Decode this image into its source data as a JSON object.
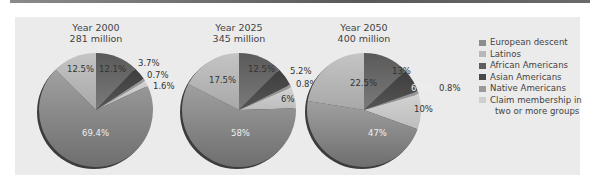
{
  "chart_data": [
    {
      "type": "pie",
      "title": "Year 2000",
      "subtitle": "281 million",
      "categories": [
        "European descent",
        "Latinos",
        "African Americans",
        "Asian Americans",
        "Native Americans",
        "Claim membership in two or more groups"
      ],
      "values": [
        69.4,
        12.5,
        12.1,
        3.7,
        0.7,
        1.6
      ],
      "labels": [
        "69.4%",
        "12.5%",
        "12.1%",
        "3.7%",
        "0.7%",
        "1.6%"
      ]
    },
    {
      "type": "pie",
      "title": "Year 2025",
      "subtitle": "345 million",
      "categories": [
        "European descent",
        "Latinos",
        "African Americans",
        "Asian Americans",
        "Native Americans",
        "Claim membership in two or more groups"
      ],
      "values": [
        58,
        17.5,
        12.5,
        5.2,
        0.8,
        6
      ],
      "labels": [
        "58%",
        "17.5%",
        "12.5%",
        "5.2%",
        "0.8%",
        "6%"
      ]
    },
    {
      "type": "pie",
      "title": "Year 2050",
      "subtitle": "400 million",
      "categories": [
        "European descent",
        "Latinos",
        "African Americans",
        "Asian Americans",
        "Native Americans",
        "Claim membership in two or more groups"
      ],
      "values": [
        47,
        22.5,
        13,
        6.7,
        0.8,
        10
      ],
      "labels": [
        "47%",
        "22.5%",
        "13%",
        "6.7%",
        "0.8%",
        "10%"
      ]
    }
  ],
  "legend": {
    "position": "right",
    "items": [
      {
        "label": "European descent",
        "color": "#8c8c8c"
      },
      {
        "label": "Latinos",
        "color": "#b8b8b8"
      },
      {
        "label": "African Americans",
        "color": "#5e5e5e"
      },
      {
        "label": "Asian Americans",
        "color": "#4a4a4a"
      },
      {
        "label": "Native Americans",
        "color": "#9a9a9a"
      },
      {
        "label": "Claim membership in",
        "label2": "two or more groups",
        "color": "#cfcfcf"
      }
    ]
  },
  "pies": [
    {
      "title": "Year 2000",
      "subtitle": "281 million",
      "labels": {
        "european": "69.4%",
        "latinos": "12.5%",
        "african": "12.1%",
        "asian": "3.7%",
        "native": "0.7%",
        "multi": "1.6%"
      }
    },
    {
      "title": "Year 2025",
      "subtitle": "345 million",
      "labels": {
        "european": "58%",
        "latinos": "17.5%",
        "african": "12.5%",
        "asian": "5.2%",
        "native": "0.8%",
        "multi": "6%"
      }
    },
    {
      "title": "Year 2050",
      "subtitle": "400 million",
      "labels": {
        "european": "47%",
        "latinos": "22.5%",
        "african": "13%",
        "asian": "6.7%",
        "native": "0.8%",
        "multi": "10%"
      }
    }
  ]
}
